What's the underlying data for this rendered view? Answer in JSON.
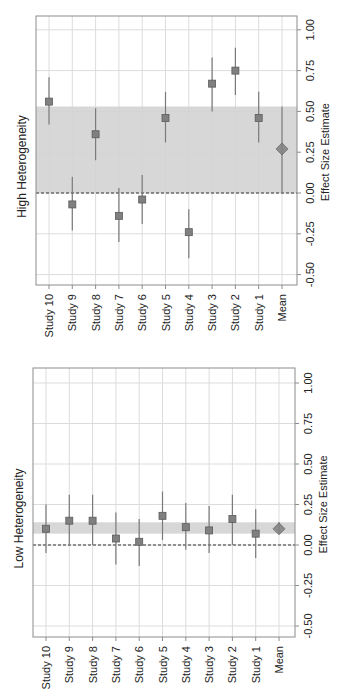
{
  "orientation": "rotated-90-ccw",
  "colors": {
    "frame": "#8c8c8c",
    "grid": "#dcdcdc",
    "band": "#d3d3d3",
    "marker": "#808080",
    "marker_border": "#5a5a5a",
    "ci_line": "#7a7a7a",
    "zero_line": "#333333",
    "text": "#222222"
  },
  "chart_data": [
    {
      "type": "forest",
      "title": "High Heterogeneity",
      "xlabel": "Effect Size Estimate",
      "ylabel": "",
      "xlim": [
        -0.55,
        1.07
      ],
      "ticks": [
        -0.5,
        -0.25,
        0.0,
        0.25,
        0.5,
        0.75,
        1.0
      ],
      "tick_labels": [
        "-0.50",
        "-0.25",
        "0.00",
        "0.25",
        "0.50",
        "0.75",
        "1.00"
      ],
      "grid": true,
      "reference_line": 0.0,
      "band": [
        0.0,
        0.53
      ],
      "categories": [
        "Study 10",
        "Study 9",
        "Study 8",
        "Study 7",
        "Study 6",
        "Study 5",
        "Study 4",
        "Study 3",
        "Study 2",
        "Study 1",
        "Mean"
      ],
      "estimates": [
        0.56,
        -0.07,
        0.36,
        -0.14,
        -0.04,
        0.46,
        -0.24,
        0.67,
        0.75,
        0.46,
        0.27
      ],
      "ci_lower": [
        0.42,
        -0.23,
        0.2,
        -0.3,
        -0.19,
        0.31,
        -0.4,
        0.5,
        0.6,
        0.31,
        0.0
      ],
      "ci_upper": [
        0.71,
        0.1,
        0.52,
        0.03,
        0.11,
        0.62,
        -0.1,
        0.83,
        0.89,
        0.62,
        0.53
      ]
    },
    {
      "type": "forest",
      "title": "Low Heterogeneity",
      "xlabel": "Effect Size Estimate",
      "ylabel": "",
      "xlim": [
        -0.55,
        1.07
      ],
      "ticks": [
        -0.5,
        -0.25,
        0.0,
        0.25,
        0.5,
        0.75,
        1.0
      ],
      "tick_labels": [
        "-0.50",
        "-0.25",
        "0.00",
        "0.25",
        "0.50",
        "0.75",
        "1.00"
      ],
      "grid": true,
      "reference_line": 0.0,
      "band": [
        0.07,
        0.14
      ],
      "categories": [
        "Study 10",
        "Study 9",
        "Study 8",
        "Study 7",
        "Study 6",
        "Study 5",
        "Study 4",
        "Study 3",
        "Study 2",
        "Study 1",
        "Mean"
      ],
      "estimates": [
        0.1,
        0.15,
        0.15,
        0.04,
        0.02,
        0.18,
        0.11,
        0.09,
        0.16,
        0.07,
        0.1
      ],
      "ci_lower": [
        -0.05,
        0.0,
        0.0,
        -0.12,
        -0.13,
        0.03,
        -0.03,
        -0.05,
        0.0,
        -0.08,
        0.07
      ],
      "ci_upper": [
        0.25,
        0.31,
        0.31,
        0.2,
        0.16,
        0.33,
        0.26,
        0.24,
        0.31,
        0.22,
        0.14
      ]
    }
  ],
  "layout": [
    {
      "frame": {
        "x0": 36,
        "x1": 297,
        "y0": 16,
        "y1": 285
      },
      "zero_y": 193,
      "px_per_unit": 163.2,
      "first_x": 49,
      "step_x": 23.3
    },
    {
      "frame": {
        "x0": 33,
        "x1": 295,
        "y0": 368,
        "y1": 637
      },
      "zero_y": 545,
      "px_per_unit": 162.0,
      "first_x": 46,
      "step_x": 23.3
    }
  ]
}
